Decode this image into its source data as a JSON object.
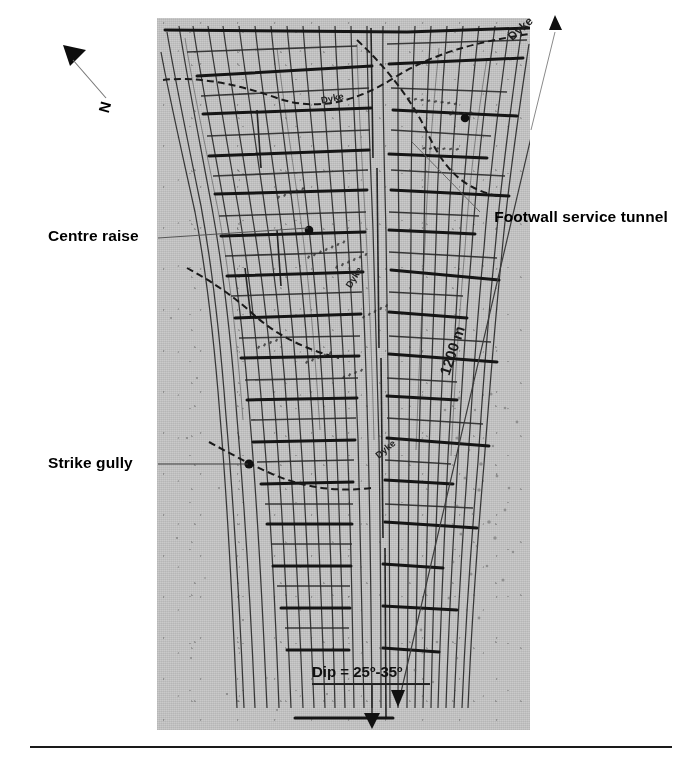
{
  "figure": {
    "kind": "mine-plan-photograph",
    "background_color": "#c6c6c6",
    "ink_color": "#1a1a1a"
  },
  "annotations": {
    "centre_raise": "Centre raise",
    "strike_gully": "Strike gully",
    "footwall_service_tunnel": "Footwall service tunnel",
    "north_label": "N",
    "scale_label": "1200 m",
    "dip_label": "Dip = 25º-35º",
    "dyke_labels": [
      "Dyke",
      "Dyke",
      "Dyke",
      "Dyke"
    ]
  },
  "icons": {
    "north_arrow": "north-arrow-icon",
    "dip_arrow": "down-arrow-icon",
    "scale_arrow_top": "arrow-up-icon",
    "scale_arrow_bottom": "arrow-down-icon",
    "centre_raise_marker": "dot-marker-icon",
    "strike_gully_marker": "dot-marker-icon"
  },
  "map_content": {
    "description": "Stope sheet / mine plan showing reef contours, strike gullies, centre raises, footwall service tunnel and dykes",
    "vertical_contour_count": 26,
    "strike_gully_count": 14,
    "dyke_count": 4
  }
}
